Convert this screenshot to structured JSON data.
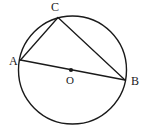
{
  "figure": {
    "background_color": "#ffffff",
    "stroke_color": "#1a1a1a",
    "width": 143,
    "height": 138
  },
  "circle": {
    "name": "main-circle",
    "center_x": 72.5,
    "center_y": 70,
    "radius": 54,
    "stroke_width": 1.4,
    "fill": "none"
  },
  "center_point": {
    "label": "O",
    "x": 71,
    "y": 70,
    "dot_radius": 2.1,
    "label_x": 70,
    "label_y": 81
  },
  "points": [
    {
      "id": "A",
      "label": "A",
      "x": 20.5,
      "y": 60,
      "label_x": 9,
      "label_y": 65
    },
    {
      "id": "B",
      "label": "B",
      "x": 125,
      "y": 80,
      "label_x": 131,
      "label_y": 85
    },
    {
      "id": "C",
      "label": "C",
      "x": 58,
      "y": 17.5,
      "label_x": 51,
      "label_y": 11
    }
  ],
  "segments": [
    {
      "id": "AB",
      "name": "diameter-ab",
      "from": "A",
      "to": "B",
      "x1": 20.5,
      "y1": 60,
      "x2": 125,
      "y2": 80
    },
    {
      "id": "AC",
      "name": "chord-ac",
      "from": "A",
      "to": "C",
      "x1": 20.5,
      "y1": 60,
      "x2": 58,
      "y2": 17.5
    },
    {
      "id": "CB",
      "name": "chord-cb",
      "from": "C",
      "to": "B",
      "x1": 58,
      "y1": 17.5,
      "x2": 125,
      "y2": 80
    }
  ],
  "labels": {
    "a": "A",
    "b": "B",
    "c": "C",
    "o": "O"
  }
}
